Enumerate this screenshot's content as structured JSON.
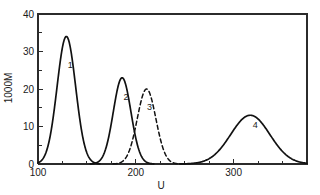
{
  "chart_data": {
    "type": "line",
    "title": "",
    "subtitle": "",
    "xlabel": "U",
    "ylabel": "1000M",
    "xlim": [
      100,
      375
    ],
    "ylim": [
      0,
      40
    ],
    "grid": false,
    "legend_position": "inline-labels",
    "x_ticks_major": [
      100,
      200,
      300
    ],
    "x_tick_labels": [
      "100",
      "200",
      "300"
    ],
    "x_ticks_minor": [
      125,
      150,
      175,
      225,
      250,
      275,
      325,
      350,
      375
    ],
    "y_ticks_major": [
      0,
      10,
      20,
      30,
      40
    ],
    "y_tick_labels": [
      "0",
      "10",
      "20",
      "30",
      "40"
    ],
    "y_ticks_minor": [
      5,
      15,
      25,
      35
    ],
    "annotations": [
      {
        "text": "1",
        "x": 133,
        "y": 25.5
      },
      {
        "text": "2",
        "x": 190,
        "y": 17.0
      },
      {
        "text": "3",
        "x": 214,
        "y": 14.5
      },
      {
        "text": "4",
        "x": 322,
        "y": 9.5
      }
    ],
    "series": [
      {
        "name": "1",
        "label": "1",
        "style": "solid",
        "color": "#111111",
        "peak_x": 129,
        "peak_y": 34,
        "width": 9.5,
        "points_note": "gaussian peak centered near U=129, height 34"
      },
      {
        "name": "2",
        "label": "2",
        "style": "solid",
        "color": "#111111",
        "peak_x": 186,
        "peak_y": 23,
        "width": 9.0,
        "points_note": "gaussian peak centered near U=186, height 23"
      },
      {
        "name": "3",
        "label": "3",
        "style": "dashed",
        "color": "#111111",
        "peak_x": 211,
        "peak_y": 20,
        "width": 9.5,
        "points_note": "dashed gaussian peak centered near U=211, height 20"
      },
      {
        "name": "4",
        "label": "4",
        "style": "solid",
        "color": "#111111",
        "peak_x": 317,
        "peak_y": 13,
        "width": 20.0,
        "points_note": "broad gaussian peak centered near U=317, height 13"
      }
    ]
  },
  "axes": {
    "x_title": "U",
    "y_title": "1000M"
  },
  "colors": {
    "background": "#ffffff",
    "frame": "#2b2b2b",
    "curve": "#111111",
    "text": "#1a1a1a"
  }
}
